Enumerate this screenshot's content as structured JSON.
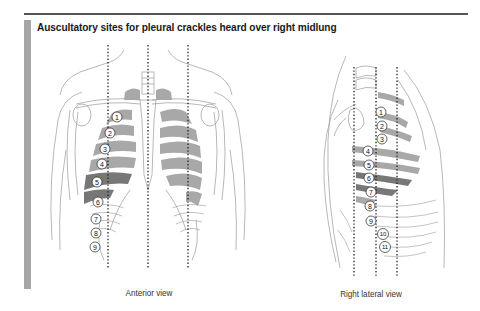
{
  "figure": {
    "title": "Auscultatory sites for pleural crackles heard over right midlung",
    "views": [
      {
        "id": "anterior",
        "caption": "Anterior view",
        "site_numbers": [
          "1",
          "2",
          "3",
          "4",
          "5",
          "6",
          "7",
          "8",
          "9"
        ],
        "guide_lines": 3
      },
      {
        "id": "right-lateral",
        "caption": "Right lateral view",
        "site_numbers": [
          "1",
          "2",
          "3",
          "4",
          "5",
          "6",
          "7",
          "8",
          "9",
          "10",
          "11"
        ],
        "guide_lines": 3
      }
    ]
  },
  "colors": {
    "rule": "#555555",
    "side_bar": "#a6a6a6",
    "lung_shade": "#a8a8a8",
    "highlight_shade": "#777777",
    "outline": "#9a9a9a",
    "dotted_line": "#222222"
  }
}
